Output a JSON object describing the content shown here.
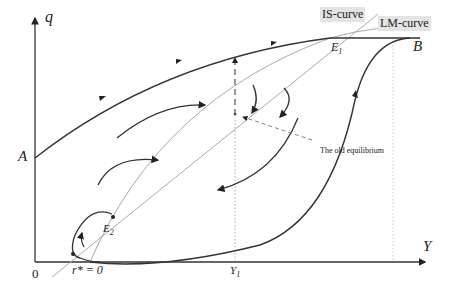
{
  "diagram": {
    "type": "phase-diagram",
    "axes": {
      "y_label": "q",
      "x_label": "Y",
      "origin_label": "0"
    },
    "curves": {
      "is_curve_label": "IS-curve",
      "lm_curve_label": "LM-curve"
    },
    "points": {
      "a_label": "A",
      "b_label": "B",
      "e1_label": "E",
      "e1_sub": "1",
      "e2_label": "E",
      "e2_sub": "2",
      "y1_label": "Y",
      "y1_sub": "1"
    },
    "annotations": {
      "r_zero": "r* = 0",
      "old_equilibrium": "The old equilibrium"
    },
    "colors": {
      "trajectory": "#333333",
      "curve": "#aaaaaa",
      "axis": "#333333",
      "label_bg": "#e4e4e4"
    }
  }
}
